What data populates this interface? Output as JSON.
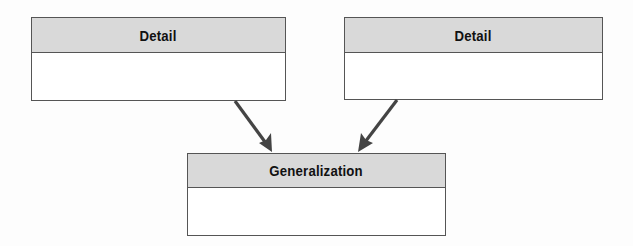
{
  "diagram": {
    "type": "generalization-hierarchy",
    "nodes": [
      {
        "id": "detail-left",
        "label": "Detail",
        "body": ""
      },
      {
        "id": "detail-right",
        "label": "Detail",
        "body": ""
      },
      {
        "id": "generalization",
        "label": "Generalization",
        "body": ""
      }
    ],
    "edges": [
      {
        "from": "detail-left",
        "to": "generalization",
        "style": "arrow"
      },
      {
        "from": "detail-right",
        "to": "generalization",
        "style": "arrow"
      }
    ],
    "colors": {
      "header_fill": "#d9d9d9",
      "body_fill": "#ffffff",
      "border": "#555555",
      "arrow": "#444444",
      "text": "#111111"
    }
  }
}
